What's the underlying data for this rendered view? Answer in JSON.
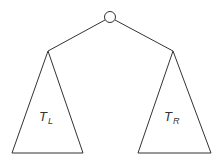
{
  "diagram": {
    "type": "binary-tree-schematic",
    "stroke_color": "#333333",
    "background": "#ffffff",
    "root": {
      "cx": 110,
      "cy": 17,
      "r": 5.5
    },
    "edges": [
      {
        "from": "root",
        "to": "left-apex",
        "x1": 105,
        "y1": 20,
        "x2": 48,
        "y2": 51
      },
      {
        "from": "root",
        "to": "right-apex",
        "x1": 115,
        "y1": 20,
        "x2": 173,
        "y2": 51
      }
    ],
    "subtrees": [
      {
        "id": "left",
        "label_main": "T",
        "label_sub": "L",
        "points": "48,51 12,153 83,153",
        "label_x": 39,
        "label_y": 121,
        "sub_x": 48,
        "sub_y": 124
      },
      {
        "id": "right",
        "label_main": "T",
        "label_sub": "R",
        "points": "173,51 138,153 211,153",
        "label_x": 164,
        "label_y": 121,
        "sub_x": 173,
        "sub_y": 124
      }
    ]
  }
}
